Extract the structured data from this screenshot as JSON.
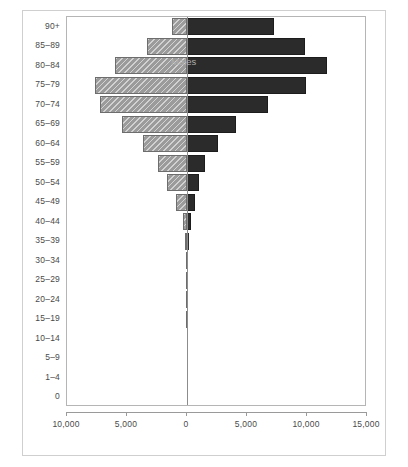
{
  "chart_data": {
    "type": "bar",
    "orientation": "horizontal",
    "subtype": "population-pyramid",
    "title": "",
    "xlabel": "",
    "ylabel": "",
    "grid": false,
    "legend_position": "inside-plot",
    "axis": {
      "x_tick_labels": [
        "10,000",
        "5,000",
        "0",
        "5,000",
        "10,000",
        "15,000"
      ],
      "x_tick_values": [
        -10000,
        -5000,
        0,
        5000,
        10000,
        15000
      ],
      "xlim": [
        -10000,
        15000
      ],
      "zero_position": 0
    },
    "categories": [
      "90+",
      "85–89",
      "80–84",
      "75–79",
      "70–74",
      "65–69",
      "60–64",
      "55–59",
      "50–54",
      "45–49",
      "40–44",
      "35–39",
      "30–34",
      "25–29",
      "20–24",
      "15–19",
      "10–14",
      "5–9",
      "1–4",
      "0"
    ],
    "series": [
      {
        "name": "Males",
        "color": "#9b9b9b",
        "pattern": "diagonal-hatch",
        "direction": "left",
        "values": [
          1250,
          3350,
          6000,
          7650,
          7250,
          5450,
          3700,
          2450,
          1700,
          950,
          350,
          170,
          110,
          80,
          60,
          50,
          0,
          0,
          0,
          0
        ]
      },
      {
        "name": "Females",
        "color": "#2b2b2b",
        "pattern": "solid",
        "direction": "right",
        "values": [
          7250,
          9850,
          11700,
          9950,
          6750,
          4050,
          2550,
          1500,
          1000,
          700,
          350,
          180,
          120,
          90,
          70,
          55,
          0,
          0,
          0,
          0
        ]
      }
    ],
    "annotations": [
      {
        "text": "Males",
        "series": "Males"
      },
      {
        "text": "Females",
        "series": "Females"
      }
    ]
  }
}
